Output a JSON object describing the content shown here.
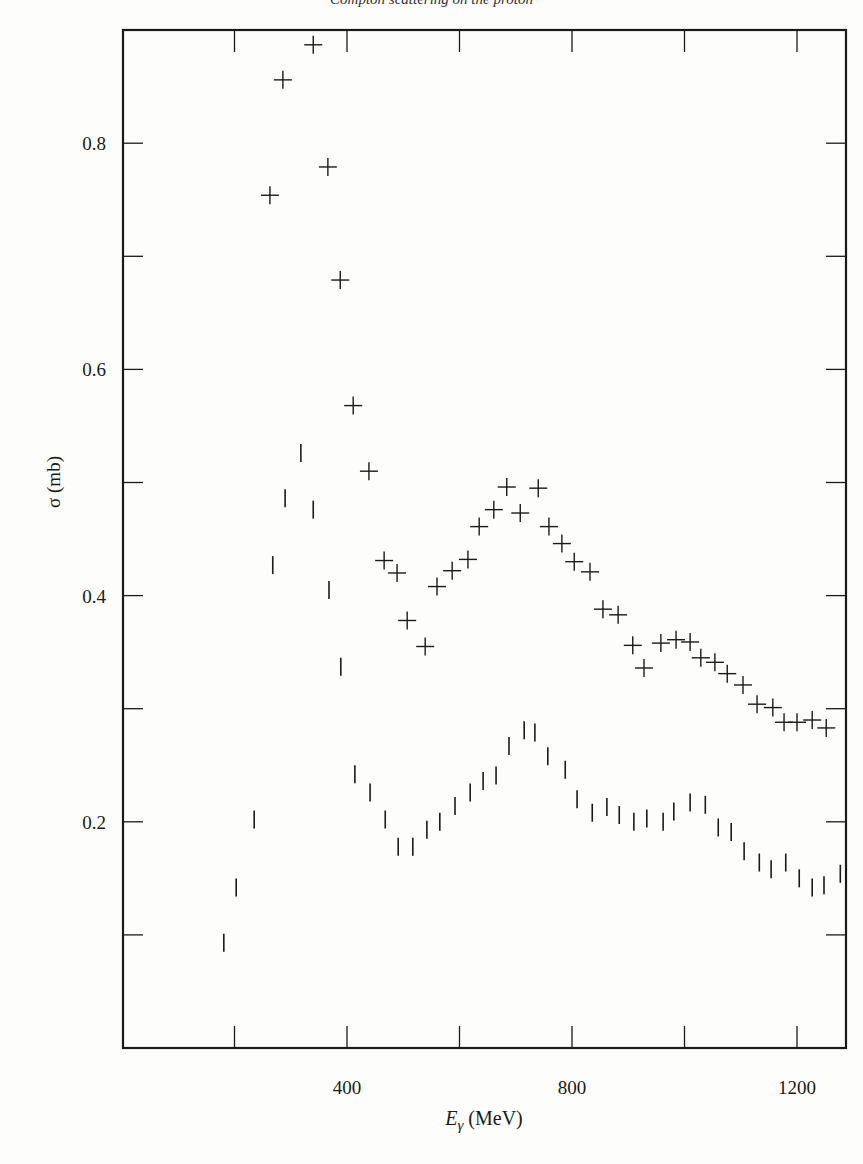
{
  "header": {
    "text": "Compton scattering on the proton"
  },
  "chart_data": {
    "type": "scatter",
    "title": "",
    "xlabel": "E_γ (MeV)",
    "xlabel_main": "E",
    "xlabel_sub": "γ",
    "xlabel_unit": " (MeV)",
    "ylabel": "σ (mb)",
    "xlim": [
      0,
      1285
    ],
    "ylim": [
      0,
      0.9
    ],
    "x_major_ticks": [
      200,
      400,
      600,
      800,
      1000,
      1200
    ],
    "x_tick_labels": [
      {
        "value": 400,
        "label": "400"
      },
      {
        "value": 800,
        "label": "800"
      },
      {
        "value": 1200,
        "label": "1200"
      }
    ],
    "y_major_ticks": [
      0.1,
      0.2,
      0.3,
      0.4,
      0.5,
      0.6,
      0.7,
      0.8
    ],
    "y_tick_labels": [
      {
        "value": 0.2,
        "label": "0.2"
      },
      {
        "value": 0.4,
        "label": "0.4"
      },
      {
        "value": 0.6,
        "label": "0.6"
      },
      {
        "value": 0.8,
        "label": "0.8"
      }
    ],
    "grid": false,
    "legend": null,
    "series": [
      {
        "name": "upper (crosses)",
        "marker": "plus",
        "x": [
          263,
          286,
          340,
          366,
          388,
          411,
          439,
          466,
          489,
          507,
          539,
          560,
          587,
          615,
          635,
          661,
          684,
          708,
          740,
          759,
          782,
          804,
          832,
          855,
          882,
          908,
          928,
          958,
          985,
          1010,
          1029,
          1054,
          1076,
          1104,
          1129,
          1157,
          1177,
          1200,
          1227,
          1252
        ],
        "y": [
          0.754,
          0.856,
          0.887,
          0.779,
          0.679,
          0.568,
          0.51,
          0.431,
          0.42,
          0.378,
          0.355,
          0.408,
          0.422,
          0.432,
          0.461,
          0.476,
          0.496,
          0.473,
          0.495,
          0.461,
          0.446,
          0.43,
          0.421,
          0.388,
          0.383,
          0.356,
          0.336,
          0.358,
          0.361,
          0.359,
          0.345,
          0.341,
          0.331,
          0.321,
          0.304,
          0.301,
          0.288,
          0.288,
          0.29,
          0.283
        ]
      },
      {
        "name": "lower (vertical bars)",
        "marker": "vbar",
        "x": [
          181,
          203,
          235,
          268,
          290,
          318,
          340,
          368,
          389,
          414,
          441,
          468,
          491,
          517,
          542,
          565,
          592,
          619,
          642,
          665,
          688,
          715,
          734,
          757,
          788,
          809,
          836,
          862,
          884,
          910,
          933,
          962,
          981,
          1010,
          1037,
          1060,
          1083,
          1106,
          1133,
          1154,
          1180,
          1204,
          1227,
          1248,
          1277
        ],
        "y": [
          0.093,
          0.142,
          0.202,
          0.427,
          0.486,
          0.526,
          0.476,
          0.405,
          0.337,
          0.242,
          0.226,
          0.202,
          0.178,
          0.178,
          0.193,
          0.2,
          0.214,
          0.226,
          0.236,
          0.241,
          0.267,
          0.281,
          0.279,
          0.258,
          0.246,
          0.22,
          0.208,
          0.213,
          0.206,
          0.2,
          0.203,
          0.2,
          0.209,
          0.217,
          0.215,
          0.195,
          0.191,
          0.174,
          0.164,
          0.158,
          0.164,
          0.15,
          0.142,
          0.144,
          0.154
        ]
      }
    ]
  }
}
